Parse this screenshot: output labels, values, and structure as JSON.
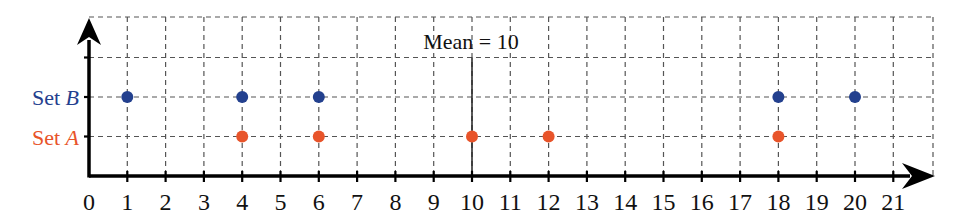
{
  "chart_data": {
    "type": "scatter",
    "title": "",
    "xlabel": "",
    "ylabel": "",
    "xlim": [
      0,
      21
    ],
    "x_ticks": [
      0,
      1,
      2,
      3,
      4,
      5,
      6,
      7,
      8,
      9,
      10,
      11,
      12,
      13,
      14,
      15,
      16,
      17,
      18,
      19,
      20,
      21
    ],
    "grid": true,
    "series": [
      {
        "name": "Set A",
        "label_prefix": "Set ",
        "label_var": "A",
        "color": "#e8542a",
        "row": 1,
        "values": [
          4,
          6,
          10,
          12,
          18
        ]
      },
      {
        "name": "Set B",
        "label_prefix": "Set ",
        "label_var": "B",
        "color": "#23408e",
        "row": 2,
        "values": [
          1,
          4,
          6,
          18,
          20
        ]
      }
    ],
    "annotations": [
      {
        "type": "vline",
        "x": 10,
        "label": "Mean = 10"
      }
    ]
  },
  "labels": {
    "mean": "Mean = 10"
  }
}
